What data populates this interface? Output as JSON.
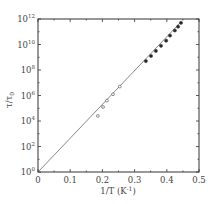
{
  "chart_data": {
    "type": "scatter",
    "title": "",
    "xlabel": "1/T (K⁻¹)",
    "ylabel": "τ/τ₀",
    "xlim": [
      0,
      0.5
    ],
    "ylim_log10": [
      0,
      12
    ],
    "yscale": "log",
    "grid": false,
    "legend": null,
    "x_ticks": [
      "0",
      "0.1",
      "0.2",
      "0.3",
      "0.4",
      "0.5"
    ],
    "y_ticks": [
      "10^0",
      "10^2",
      "10^4",
      "10^6",
      "10^8",
      "10^10",
      "10^12"
    ],
    "series": [
      {
        "name": "open circles",
        "marker": "open-circle",
        "x": [
          0.186,
          0.202,
          0.214,
          0.233,
          0.254
        ],
        "log10_y": [
          4.4,
          5.1,
          5.6,
          6.1,
          6.7
        ]
      },
      {
        "name": "filled circles",
        "marker": "filled-circle",
        "x": [
          0.335,
          0.351,
          0.366,
          0.382,
          0.398,
          0.41,
          0.425,
          0.435,
          0.444
        ],
        "log10_y": [
          8.7,
          9.1,
          9.5,
          9.9,
          10.3,
          10.7,
          11.1,
          11.4,
          11.7
        ]
      },
      {
        "name": "fit line",
        "marker": "line",
        "x": [
          0,
          0.445
        ],
        "log10_y": [
          0,
          11.8
        ]
      }
    ]
  },
  "labels": {
    "x_axis": "1/T (K",
    "x_axis_sup": "-1",
    "x_axis_end": ")",
    "y_axis_main": "τ/τ",
    "y_axis_sub": "0",
    "x_ticks": [
      "0",
      "0.1",
      "0.2",
      "0.3",
      "0.4",
      "0.5"
    ],
    "y_ticks_exp": [
      "0",
      "2",
      "4",
      "6",
      "8",
      "10",
      "12"
    ],
    "y_tick_base": "10"
  }
}
